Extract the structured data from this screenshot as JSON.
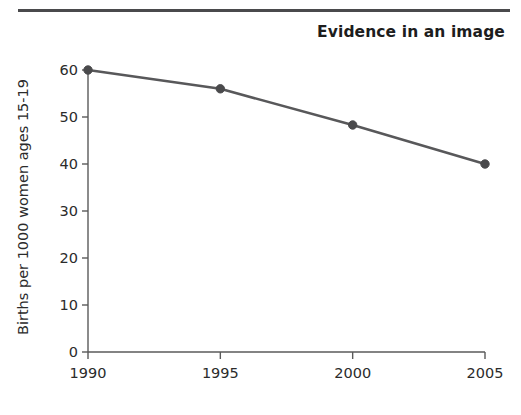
{
  "figure": {
    "title": "Evidence in an image",
    "divider": "horizontal-rule"
  },
  "chart_data": {
    "type": "line",
    "title": "Evidence in an image",
    "xlabel": "",
    "ylabel": "Births per 1000 women ages 15-19",
    "categories": [
      "1990",
      "1995",
      "2000",
      "2005"
    ],
    "x": [
      1990,
      1995,
      2000,
      2005
    ],
    "values": [
      60,
      56,
      48.3,
      40
    ],
    "series": [
      {
        "name": "Births per 1000 women ages 15-19",
        "values": [
          60,
          56,
          48.3,
          40
        ]
      }
    ],
    "xlim": [
      1990,
      2005
    ],
    "ylim": [
      0,
      60
    ],
    "yticks": [
      "0",
      "10",
      "20",
      "30",
      "40",
      "50",
      "60"
    ],
    "ytick_values": [
      0,
      10,
      20,
      30,
      40,
      50,
      60
    ],
    "xticks": [
      "1990",
      "1995",
      "2000",
      "2005"
    ],
    "grid": false,
    "legend": "none",
    "marker": "circle",
    "line_color": "#58585a",
    "marker_color": "#4a4a4c",
    "axis_color": "#5a5a5a"
  }
}
